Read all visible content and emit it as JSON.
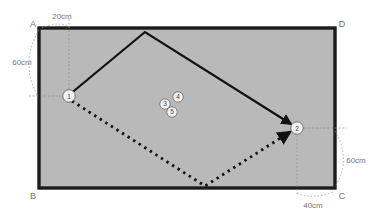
{
  "figure": {
    "type": "geometry-diagram",
    "background_color": "#ffffff",
    "plate": {
      "name": "rectangle-plate",
      "fill_color": "#b9b9b9",
      "border_color": "#1c1c1c",
      "x": 39,
      "y": 28,
      "width": 296,
      "height": 160
    },
    "corner_labels": [
      {
        "id": "A",
        "text": "A",
        "x": 33,
        "y": 25,
        "corner": "top-left"
      },
      {
        "id": "D",
        "text": "D",
        "x": 339,
        "y": 25,
        "corner": "top-right"
      },
      {
        "id": "B",
        "text": "B",
        "x": 33,
        "y": 198,
        "corner": "bottom-left"
      },
      {
        "id": "C",
        "text": "C",
        "x": 339,
        "y": 198,
        "corner": "bottom-right"
      }
    ],
    "dimensions": [
      {
        "id": "top-left-horizontal",
        "text": "20cm",
        "x": 62,
        "y": 20,
        "orientation": "horizontal",
        "side": "top-left"
      },
      {
        "id": "left-vertical",
        "text": "60cm",
        "x": 24,
        "y": 62,
        "orientation": "vertical",
        "side": "left"
      },
      {
        "id": "right-vertical",
        "text": "60cm",
        "x": 352,
        "y": 160,
        "orientation": "vertical",
        "side": "right"
      },
      {
        "id": "bottom-right-horizontal",
        "text": "40cm",
        "x": 310,
        "y": 203,
        "orientation": "horizontal",
        "side": "bottom-right"
      }
    ],
    "path_nodes": [
      {
        "label": "1",
        "x": 69,
        "y": 96,
        "r": 6.2
      },
      {
        "label": "2",
        "x": 297,
        "y": 128,
        "r": 6.2
      },
      {
        "label": "3",
        "x": 165,
        "y": 104,
        "r": 5.2
      },
      {
        "label": "4",
        "x": 178,
        "y": 98,
        "r": 5.2
      },
      {
        "label": "5",
        "x": 172,
        "y": 112,
        "r": 5.2
      }
    ],
    "solid_path": {
      "name": "solid-tool-path",
      "color": "#111111",
      "width": 2.2,
      "points": "69,96 145,32 293,125",
      "arrow_at": {
        "x": 293,
        "y": 125
      }
    },
    "dotted_path": {
      "name": "dotted-tool-path",
      "color": "#111111",
      "width": 2.6,
      "dash": "2.4 4.2",
      "points": "72,101 205,186 292,131",
      "arrow_at": {
        "x": 292,
        "y": 131
      }
    },
    "guide_lines": [
      {
        "id": "guide-top-left-vertical",
        "x1": 69,
        "y1": 20,
        "x2": 69,
        "y2": 96
      },
      {
        "id": "guide-left-horizontal",
        "x1": 30,
        "y1": 96,
        "x2": 69,
        "y2": 96
      },
      {
        "id": "guide-right-horizontal",
        "x1": 297,
        "y1": 128,
        "x2": 345,
        "y2": 128
      },
      {
        "id": "guide-bottom-right-vertical",
        "x1": 297,
        "y1": 128,
        "x2": 297,
        "y2": 196
      }
    ]
  }
}
